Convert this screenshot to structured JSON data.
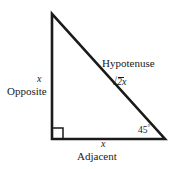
{
  "figure": {
    "background_color": "#ffffff",
    "stroke_color": "#1a1a1a"
  },
  "triangle": {
    "vertices": {
      "top": [
        52,
        14
      ],
      "bottom_left": [
        52,
        139
      ],
      "bottom_right": [
        165,
        139
      ]
    },
    "stroke_width": 2.6
  },
  "right_angle_marker": {
    "vertex": [
      52,
      139
    ],
    "size": 11
  },
  "labels": {
    "opposite": "Opposite",
    "opposite_var": "x",
    "adjacent": "Adjacent",
    "adjacent_var": "x",
    "hypotenuse": "Hypotenuse",
    "hypotenuse_radical_sign": "√",
    "hypotenuse_radicand": "2",
    "hypotenuse_var": "x",
    "angle_value": "45",
    "angle_degree_symbol": "°"
  }
}
